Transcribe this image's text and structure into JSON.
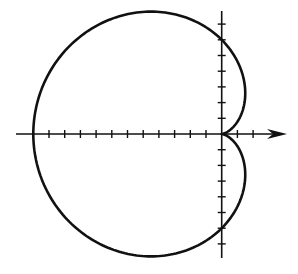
{
  "diagram": {
    "type": "polar-curve",
    "curve": "cardioid",
    "equation_form": "r = a(1 - cos θ)",
    "a": 6,
    "unit_px": 15.7,
    "origin_px": [
      221.7,
      134
    ],
    "x_axis": {
      "left_px": 16,
      "right_px": 287,
      "ticks_left": 12,
      "ticks_right": 2,
      "arrow": "right"
    },
    "y_axis": {
      "top_px": 11,
      "bottom_px": 258,
      "ticks_up": 7,
      "ticks_down": 7
    },
    "stroke_color": "#111111",
    "background_color": "#ffffff"
  }
}
